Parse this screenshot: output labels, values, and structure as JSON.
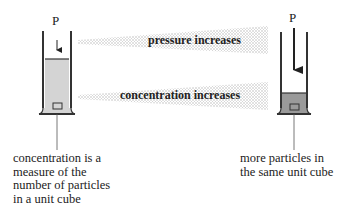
{
  "diagram": {
    "left_cylinder": {
      "pressure_label": "P",
      "caption": [
        "concentration is a",
        "measure of the",
        "number of particles",
        "in a unit cube"
      ]
    },
    "right_cylinder": {
      "pressure_label": "P",
      "caption": [
        "more particles in",
        "the same unit cube"
      ]
    },
    "bands": [
      {
        "label": "pressure increases"
      },
      {
        "label": "concentration increases"
      }
    ],
    "colors": {
      "gas_fill": "#d4d4d4",
      "compressed_gas_fill": "#9a9a9a",
      "wall": "#333333",
      "band_dots": "#b0b0b0"
    }
  }
}
